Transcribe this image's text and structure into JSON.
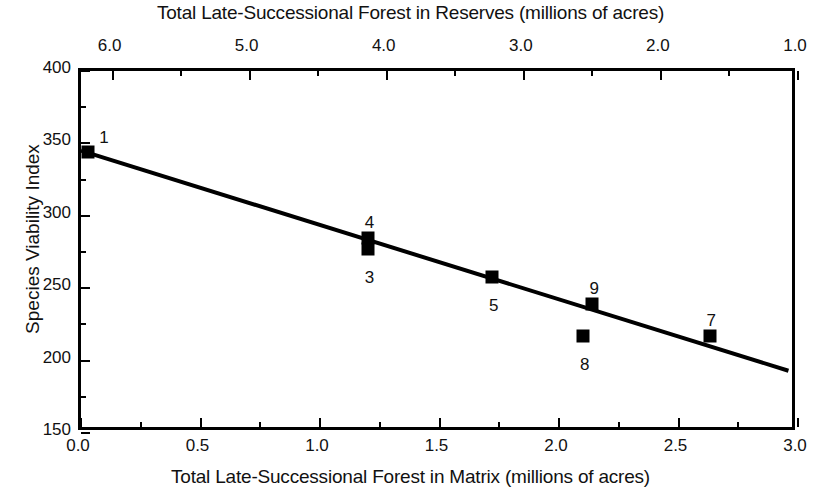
{
  "chart": {
    "top_axis_title": "Total Late-Successional Forest in Reserves (millions of acres)",
    "bottom_axis_title": "Total Late-Successional Forest in Matrix (millions of acres)",
    "y_axis_title": "Species Viability Index"
  },
  "chart_data": {
    "type": "scatter",
    "title": "",
    "subtitle": "",
    "xlabel": "Total Late-Successional Forest in Matrix (millions of acres)",
    "ylabel": "Species Viability Index",
    "x2label": "Total Late-Successional Forest in Reserves (millions of acres)",
    "xlim": [
      0.0,
      3.0
    ],
    "ylim": [
      150,
      400
    ],
    "x2lim": [
      6.23,
      1.0
    ],
    "grid": false,
    "legend": "none",
    "x_ticks": [
      "0.0",
      "0.5",
      "1.0",
      "1.5",
      "2.0",
      "2.5",
      "3.0"
    ],
    "x_tick_values": [
      0.0,
      0.5,
      1.0,
      1.5,
      2.0,
      2.5,
      3.0
    ],
    "x_minor_values": [
      0.25,
      0.75,
      1.25,
      1.75,
      2.25,
      2.75
    ],
    "y_ticks": [
      "150",
      "200",
      "250",
      "300",
      "350",
      "400"
    ],
    "y_tick_values": [
      150,
      200,
      250,
      300,
      350,
      400
    ],
    "y_minor_values": [
      175,
      225,
      275,
      325,
      375
    ],
    "x2_ticks": [
      "6.0",
      "5.0",
      "4.0",
      "3.0",
      "2.0",
      "1.0"
    ],
    "x2_tick_values": [
      6.0,
      5.0,
      4.0,
      3.0,
      2.0,
      1.0
    ],
    "x2_minor_values": [
      5.5,
      4.5,
      3.5,
      2.5,
      1.5
    ],
    "points": [
      {
        "label": "1",
        "x": 0.03,
        "y": 344,
        "label_pos": "above-right"
      },
      {
        "label": "4",
        "x": 1.2,
        "y": 285,
        "label_pos": "above"
      },
      {
        "label": "3",
        "x": 1.2,
        "y": 277,
        "label_pos": "below"
      },
      {
        "label": "5",
        "x": 1.72,
        "y": 258,
        "label_pos": "below"
      },
      {
        "label": "9",
        "x": 2.14,
        "y": 239,
        "label_pos": "above"
      },
      {
        "label": "8",
        "x": 2.1,
        "y": 217,
        "label_pos": "below"
      },
      {
        "label": "7",
        "x": 2.63,
        "y": 217,
        "label_pos": "above"
      }
    ],
    "fit_line": {
      "x0": 0.0,
      "y0": 345,
      "x1": 2.96,
      "y1": 193,
      "style": "solid"
    },
    "marker_style": "filled-square",
    "marker_color": "#000000",
    "line_color": "#000000"
  }
}
